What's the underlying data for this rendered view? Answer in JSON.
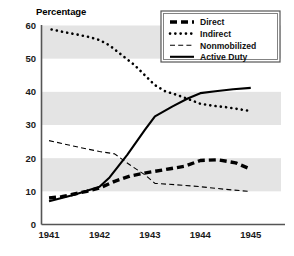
{
  "chart_data": {
    "type": "line",
    "title": "",
    "ylabel": "Percentage",
    "xlabel": "",
    "ylim": [
      0,
      60
    ],
    "yticks": [
      0,
      10,
      20,
      30,
      40,
      50,
      60
    ],
    "x": [
      1941,
      1942,
      1943,
      1944,
      1945
    ],
    "xticks": [
      "1941",
      "1942",
      "1943",
      "1944",
      "1945"
    ],
    "xlim": [
      1940.85,
      1945.6
    ],
    "grid": false,
    "banding": {
      "enabled": true,
      "color": "#e4e4e4",
      "ranges": [
        [
          10,
          20
        ],
        [
          30,
          40
        ],
        [
          50,
          60
        ]
      ]
    },
    "legend_position": "top-right",
    "series": [
      {
        "name": "Direct",
        "style": "thick-dashed",
        "color": "#000000",
        "width": 3.4,
        "dash": "7,4",
        "points": [
          [
            1941.0,
            8.0
          ],
          [
            1941.25,
            8.4
          ],
          [
            1941.5,
            9.2
          ],
          [
            1941.75,
            10.0
          ],
          [
            1942.0,
            11.0
          ],
          [
            1942.3,
            13.0
          ],
          [
            1942.6,
            14.6
          ],
          [
            1943.0,
            15.8
          ],
          [
            1943.4,
            16.8
          ],
          [
            1943.7,
            17.6
          ],
          [
            1944.0,
            19.3
          ],
          [
            1944.35,
            19.5
          ],
          [
            1944.7,
            18.6
          ],
          [
            1944.95,
            17.0
          ]
        ]
      },
      {
        "name": "Indirect",
        "style": "dotted",
        "color": "#000000",
        "width": 2.6,
        "dash": "0.1,5.2",
        "points": [
          [
            1941.05,
            58.8
          ],
          [
            1941.3,
            58.0
          ],
          [
            1941.55,
            57.3
          ],
          [
            1941.8,
            56.5
          ],
          [
            1942.0,
            55.6
          ],
          [
            1942.2,
            54.0
          ],
          [
            1942.45,
            51.0
          ],
          [
            1942.7,
            48.0
          ],
          [
            1942.9,
            45.0
          ],
          [
            1943.1,
            42.0
          ],
          [
            1943.3,
            40.2
          ],
          [
            1943.55,
            39.0
          ],
          [
            1943.8,
            37.6
          ],
          [
            1944.0,
            36.4
          ],
          [
            1944.25,
            35.8
          ],
          [
            1944.5,
            35.4
          ],
          [
            1944.75,
            34.8
          ],
          [
            1945.0,
            34.2
          ]
        ]
      },
      {
        "name": "Nonmobilized",
        "style": "thin-dashed",
        "color": "#000000",
        "width": 1.1,
        "dash": "5,3.2",
        "points": [
          [
            1941.0,
            25.3
          ],
          [
            1941.5,
            23.6
          ],
          [
            1942.0,
            22.0
          ],
          [
            1942.3,
            21.3
          ],
          [
            1942.6,
            18.0
          ],
          [
            1942.9,
            15.0
          ],
          [
            1943.1,
            12.4
          ],
          [
            1943.5,
            12.0
          ],
          [
            1944.0,
            11.4
          ],
          [
            1944.5,
            10.6
          ],
          [
            1944.95,
            10.0
          ]
        ]
      },
      {
        "name": "Active Duty",
        "style": "solid",
        "color": "#000000",
        "width": 2.1,
        "dash": "",
        "points": [
          [
            1941.0,
            7.0
          ],
          [
            1941.5,
            9.0
          ],
          [
            1942.0,
            11.4
          ],
          [
            1942.2,
            14.2
          ],
          [
            1942.55,
            21.0
          ],
          [
            1942.9,
            28.5
          ],
          [
            1943.1,
            32.6
          ],
          [
            1943.45,
            35.6
          ],
          [
            1943.75,
            38.0
          ],
          [
            1944.0,
            39.6
          ],
          [
            1944.3,
            40.2
          ],
          [
            1944.65,
            40.8
          ],
          [
            1945.0,
            41.2
          ]
        ]
      }
    ]
  },
  "legend": {
    "items": [
      {
        "label": "Direct",
        "style": "thick-dashed"
      },
      {
        "label": "Indirect",
        "style": "dotted"
      },
      {
        "label": "Nonmobilized",
        "style": "thin-dashed"
      },
      {
        "label": "Active Duty",
        "style": "solid"
      }
    ]
  }
}
